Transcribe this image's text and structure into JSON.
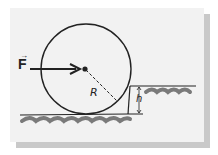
{
  "diagram": {
    "labels": {
      "force": "F",
      "force_vector_mark": "→",
      "radius": "R",
      "height": "h"
    },
    "colors": {
      "ink": "#222222",
      "ground": "#7a7a7a",
      "background": "#f2f2f2",
      "shadow": "#c9c9c9"
    }
  }
}
